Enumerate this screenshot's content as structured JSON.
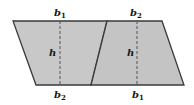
{
  "diagram": {
    "colors": {
      "fill": "#c8c8c8",
      "stroke": "#3a3a3a",
      "dash": "#555555",
      "text": "#1a1a1a"
    },
    "left_trapezoid": {
      "top_label": {
        "base": "b",
        "sub": "1"
      },
      "bottom_label": {
        "base": "b",
        "sub": "2"
      },
      "height_label": "h"
    },
    "right_trapezoid": {
      "top_label": {
        "base": "b",
        "sub": "2"
      },
      "bottom_label": {
        "base": "b",
        "sub": "1"
      },
      "height_label": "h"
    }
  }
}
